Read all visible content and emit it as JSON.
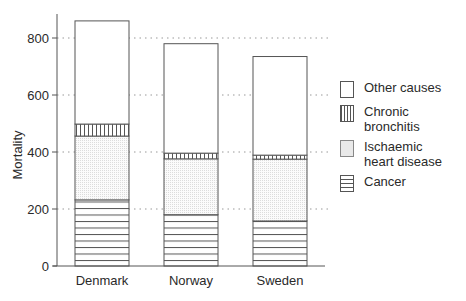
{
  "chart_data": {
    "type": "bar",
    "stacked": true,
    "title": "",
    "xlabel": "",
    "ylabel": "Mortality",
    "ylim": [
      0,
      880
    ],
    "yticks": [
      0,
      200,
      400,
      600,
      800
    ],
    "grid": "dotted horizontal lines at 200, 400, 600, 800 between bars",
    "legend_position": "right",
    "categories": [
      "Denmark",
      "Norway",
      "Sweden"
    ],
    "series": [
      {
        "name": "Cancer",
        "pattern": "horizontal-lines",
        "values": [
          232,
          180,
          158
        ]
      },
      {
        "name": "Ischaemic heart disease",
        "pattern": "stipple",
        "values": [
          224,
          196,
          217
        ]
      },
      {
        "name": "Chronic bronchitis",
        "pattern": "vertical-lines",
        "values": [
          42,
          20,
          14
        ]
      },
      {
        "name": "Other causes",
        "pattern": "blank",
        "values": [
          362,
          384,
          346
        ]
      }
    ],
    "totals": [
      860,
      780,
      735
    ]
  },
  "axis": {
    "ylabel": "Mortality",
    "ticks": [
      "0",
      "200",
      "400",
      "600",
      "800"
    ],
    "categories": [
      "Denmark",
      "Norway",
      "Sweden"
    ]
  },
  "legend": [
    {
      "label": "Other causes",
      "key": "other"
    },
    {
      "label": "Chronic\nbronchitis",
      "key": "bronchitis"
    },
    {
      "label": "Ischaemic\nheart disease",
      "key": "ihd"
    },
    {
      "label": "Cancer",
      "key": "cancer"
    }
  ],
  "colors": {
    "ink": "#2a2a2a",
    "line": "#555555",
    "stipple": "#cfcfcf",
    "grid": "#999999"
  }
}
